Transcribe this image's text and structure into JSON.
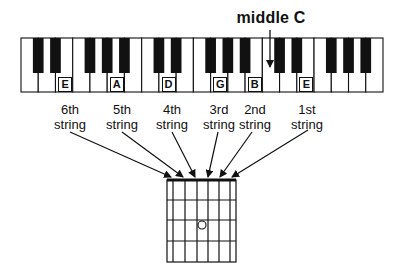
{
  "title_annotation": "middle C",
  "keyboard": {
    "white_keys": [
      "C",
      "D",
      "E",
      "F",
      "G",
      "A",
      "B",
      "C",
      "D",
      "E",
      "F",
      "G",
      "A",
      "B",
      "C",
      "D",
      "E",
      "F",
      "G",
      "A",
      "B"
    ],
    "labeled_keys": [
      {
        "note": "E",
        "white_index": 2
      },
      {
        "note": "A",
        "white_index": 5
      },
      {
        "note": "D",
        "white_index": 8
      },
      {
        "note": "G",
        "white_index": 11
      },
      {
        "note": "B",
        "white_index": 13
      },
      {
        "note": "E",
        "white_index": 16
      }
    ],
    "middle_c_white_index": 14
  },
  "strings": [
    {
      "label_line1": "6th",
      "label_line2": "string",
      "note": "E"
    },
    {
      "label_line1": "5th",
      "label_line2": "string",
      "note": "A"
    },
    {
      "label_line1": "4th",
      "label_line2": "string",
      "note": "D"
    },
    {
      "label_line1": "3rd",
      "label_line2": "string",
      "note": "G"
    },
    {
      "label_line1": "2nd",
      "label_line2": "string",
      "note": "B"
    },
    {
      "label_line1": "1st",
      "label_line2": "string",
      "note": "E"
    }
  ],
  "fretboard": {
    "strings": 6,
    "frets": 4,
    "marker": {
      "string_index": 3,
      "fret": 3,
      "shape": "open-circle"
    }
  },
  "colors": {
    "ink": "#111111",
    "background": "#ffffff"
  }
}
